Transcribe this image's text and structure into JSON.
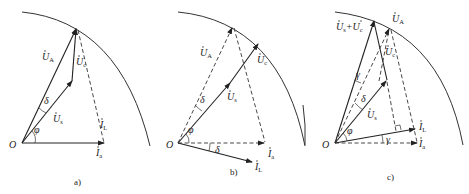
{
  "figure": {
    "panels": [
      {
        "id": "a",
        "caption": "a)",
        "origin_label": "O",
        "labels": {
          "UA": {
            "base": "U",
            "sub": "A"
          },
          "Uc": {
            "base": "U",
            "sub": "c"
          },
          "Us": {
            "base": "U",
            "sub": "s"
          },
          "IL": {
            "base": "I",
            "sub": "L"
          },
          "Ia": {
            "base": "I",
            "sub": "a"
          },
          "delta": "δ",
          "phi": "φ"
        }
      },
      {
        "id": "b",
        "caption": "b)",
        "origin_label": "O",
        "labels": {
          "UA": {
            "base": "U",
            "sub": "A"
          },
          "Uc": {
            "base": "U",
            "sub": "c"
          },
          "Us": {
            "base": "U",
            "sub": "s"
          },
          "IL": {
            "base": "I",
            "sub": "L"
          },
          "Ia": {
            "base": "I",
            "sub": "a"
          },
          "delta": "δ",
          "delta2": "δ",
          "phi": "φ"
        }
      },
      {
        "id": "c",
        "caption": "c)",
        "origin_label": "O",
        "labels": {
          "UsUc": {
            "base1": "U",
            "sub1": "s",
            "plus": "+",
            "base2": "U",
            "sub2": "c"
          },
          "UA": {
            "base": "U",
            "sub": "A"
          },
          "Uc": {
            "base": "U",
            "sub": "c"
          },
          "Us": {
            "base": "U",
            "sub": "s"
          },
          "IL": {
            "base": "I",
            "sub": "L"
          },
          "Ia": {
            "base": "I",
            "sub": "a"
          },
          "gamma": "γ",
          "gamma2": "γ",
          "delta": "δ",
          "phi": "φ"
        }
      }
    ]
  }
}
